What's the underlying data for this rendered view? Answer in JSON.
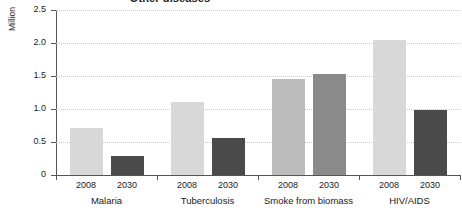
{
  "chart_data": {
    "type": "bar",
    "title": "Other diseases",
    "xlabel": "",
    "ylabel": "Million",
    "ylim": [
      0,
      2.5
    ],
    "yticks": [
      "0",
      "0.5",
      "1.0",
      "1.5",
      "2.0",
      "2.5"
    ],
    "ytick_values": [
      0,
      0.5,
      1.0,
      1.5,
      2.0,
      2.5
    ],
    "grid": true,
    "legend": "none",
    "categories": [
      "Malaria",
      "Tuberculosis",
      "Smoke from biomass",
      "HIV/AIDS"
    ],
    "subcategories": [
      "2008",
      "2030"
    ],
    "series": [
      {
        "name": "2008",
        "values": [
          0.71,
          1.1,
          1.45,
          2.04
        ]
      },
      {
        "name": "2030",
        "values": [
          0.29,
          0.56,
          1.53,
          0.99
        ]
      }
    ],
    "bars": [
      {
        "group": "Malaria",
        "year": "2008",
        "value": 0.71,
        "color": "#d8d8d8"
      },
      {
        "group": "Malaria",
        "year": "2030",
        "value": 0.29,
        "color": "#4a4a4a"
      },
      {
        "group": "Tuberculosis",
        "year": "2008",
        "value": 1.1,
        "color": "#d8d8d8"
      },
      {
        "group": "Tuberculosis",
        "year": "2030",
        "value": 0.56,
        "color": "#4a4a4a"
      },
      {
        "group": "Smoke from biomass",
        "year": "2008",
        "value": 1.45,
        "color": "#bcbcbc"
      },
      {
        "group": "Smoke from biomass",
        "year": "2030",
        "value": 1.53,
        "color": "#8a8a8a"
      },
      {
        "group": "HIV/AIDS",
        "year": "2008",
        "value": 2.04,
        "color": "#d8d8d8"
      },
      {
        "group": "HIV/AIDS",
        "year": "2030",
        "value": 0.99,
        "color": "#4a4a4a"
      }
    ],
    "colors": {
      "bar_2008_light": "#d8d8d8",
      "bar_2030_dark": "#4a4a4a",
      "bar_2008_mid": "#bcbcbc",
      "bar_2030_mid": "#8a8a8a",
      "axis": "#555555",
      "grid": "#c9c9c9",
      "text": "#1a1a1a",
      "background": "#ffffff"
    }
  }
}
